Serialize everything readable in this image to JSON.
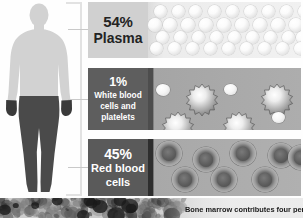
{
  "diagram": {
    "figure": {
      "name": "human-body-silhouette",
      "upper_body_color": "#d2d2d2",
      "lower_body_color": "#4a4a4a",
      "hand_color": "#3a3a3a"
    },
    "bracket": {
      "color": "#e2e2e2",
      "leader_color": "#c9c9c9"
    },
    "components": [
      {
        "id": "plasma",
        "percent": "54%",
        "name": "Plasma",
        "label_bg": "#d0d0d0",
        "label_fg": "#232323",
        "field_bg": "#f1f1f1",
        "cell_type": "plasma-droplet",
        "cell_count": 24
      },
      {
        "id": "white-blood-cells",
        "percent": "1%",
        "name": "White blood cells and platelets",
        "name_line1": "White blood",
        "name_line2": "cells and",
        "name_line3": "platelets",
        "label_bg": "#5e5e5e",
        "label_fg": "#ffffff",
        "field_bg": "#a9a9a9",
        "cell_type": "spiky-leukocyte",
        "cell_count": 7
      },
      {
        "id": "red-blood-cells",
        "percent": "45%",
        "name": "Red blood cells",
        "name_line1": "Red blood",
        "name_line2": "cells",
        "label_bg": "#5a5a5a",
        "label_fg": "#ffffff",
        "field_bg": "#acacac",
        "cell_type": "biconcave-erythrocyte",
        "cell_count": 7
      }
    ]
  },
  "footer": {
    "photo_name": "bone-marrow-micrograph",
    "caption": "Bone marrow contributes four per"
  },
  "chart_data": {
    "type": "pie",
    "categories": [
      "Plasma",
      "White blood cells and platelets",
      "Red blood cells"
    ],
    "values": [
      54,
      1,
      45
    ],
    "labels": [
      "54%",
      "1%",
      "45%"
    ],
    "unit": "percent",
    "colors": [
      "#d0d0d0",
      "#5e5e5e",
      "#5a5a5a"
    ],
    "legend": "inline-labels",
    "grid": false
  }
}
